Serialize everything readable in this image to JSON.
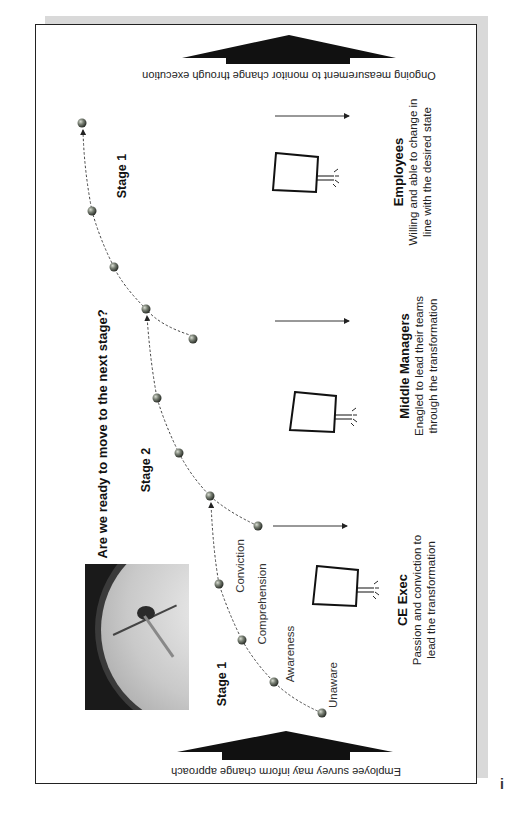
{
  "diagram": {
    "orientation": "rotated 90 degrees counter-clockwise (landscape slide placed in portrait page)",
    "question": "Are we ready to move to the next stage?",
    "top_banner": {
      "text": "Employee survey may inform change approach",
      "icon": "up-arrow-icon"
    },
    "end_banner": {
      "text": "Ongoing measurement to monitor change through execution",
      "icon": "up-arrow-icon"
    },
    "stages": [
      {
        "label": "Stage 1"
      },
      {
        "label": "Stage 2"
      },
      {
        "label": "Stage 1"
      }
    ],
    "steps": [
      "Unaware",
      "Awareness",
      "Comprehension",
      "Conviction"
    ],
    "groups": [
      {
        "title": "CE Exec",
        "line1": "Passion and conviction to",
        "line2": "lead the transformation",
        "icon": "signpost-icon"
      },
      {
        "title": "Middle Managers",
        "line1": "Enagled to lead their teams",
        "line2": "through the transformation",
        "icon": "signpost-icon"
      },
      {
        "title": "Employees",
        "line1": "Willing and able to change in",
        "line2": "line with the desired state",
        "icon": "signpost-icon"
      }
    ],
    "photo": {
      "subject": "barometer-dial-photo"
    },
    "margin_mark": "i",
    "colors": {
      "frame": "#222222",
      "shadow": "#d9d9d9",
      "arrow_fill": "#111111",
      "sphere": "#6a6f66"
    }
  }
}
